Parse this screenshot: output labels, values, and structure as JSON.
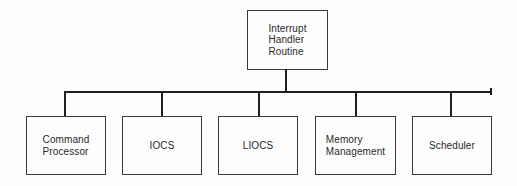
{
  "diagram": {
    "type": "hierarchy",
    "root": {
      "id": "interrupt-handler-routine",
      "label": "Interrupt\nHandler\nRoutine"
    },
    "children": [
      {
        "id": "command-processor",
        "label": "Command\nProcessor"
      },
      {
        "id": "iocs",
        "label": "IOCS"
      },
      {
        "id": "liocs",
        "label": "LIOCS"
      },
      {
        "id": "memory-management",
        "label": "Memory\nManagement"
      },
      {
        "id": "scheduler",
        "label": "Scheduler"
      }
    ],
    "colors": {
      "line": "#1f1f1f",
      "box_border": "#3a3a3a",
      "text": "#2a2a2a",
      "background": "#fdfdfd"
    }
  }
}
